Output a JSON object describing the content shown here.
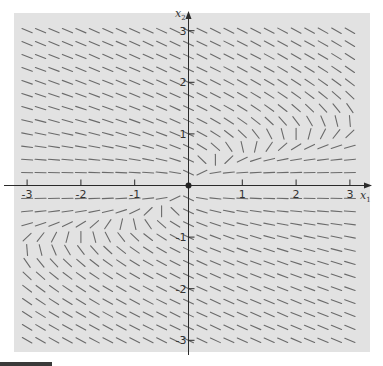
{
  "chart_data": {
    "type": "direction_field",
    "title": "",
    "xlabel": "x1",
    "ylabel": "x2",
    "xlim": [
      -3,
      3
    ],
    "ylim": [
      -3,
      3
    ],
    "x_ticks": [
      -3,
      -2,
      -1,
      1,
      2,
      3
    ],
    "y_ticks": [
      -3,
      -2,
      -1,
      1,
      2,
      3
    ],
    "x_tick_labels": [
      "-3",
      "-2",
      "-1",
      "1",
      "2",
      "3"
    ],
    "y_tick_labels": [
      "-3",
      "-2",
      "-1",
      "1",
      "2",
      "3"
    ],
    "grid": false,
    "legend": null,
    "field_grid_step": 0.25,
    "field_description": "Slope segments on a 0.25-spaced grid over [-3,3]x[-3,3]; point symmetric about origin; segments curve to vertical along a parabola-like nullcline in quadrants I and III; far field slope about -0.5; near x1-axis slopes nearly horizontal",
    "sample_slopes": [
      {
        "x1": -2.5,
        "x2": 2.5,
        "slope": -0.45
      },
      {
        "x1": 2.5,
        "x2": -2.5,
        "slope": -0.45
      },
      {
        "x1": 2.5,
        "x2": 0.25,
        "slope": 0.03
      },
      {
        "x1": 2.9,
        "x2": 1.3,
        "slope": "vertical"
      },
      {
        "x1": 1.0,
        "x2": 0.5,
        "slope": "vertical"
      },
      {
        "x1": -1.0,
        "x2": -0.5,
        "slope": "vertical"
      },
      {
        "x1": -2.9,
        "x2": -1.3,
        "slope": "vertical"
      }
    ],
    "origin_marker": true
  },
  "colors": {
    "panel": "#e2e2e2",
    "segment": "#6a6a6a",
    "axis": "#2a2a2a"
  },
  "labels": {
    "x_axis": "x",
    "x_axis_sub": "1",
    "y_axis": "x",
    "y_axis_sub": "2"
  }
}
